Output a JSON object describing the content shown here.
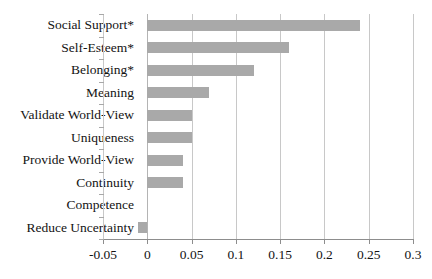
{
  "chart_data": {
    "type": "bar",
    "orientation": "horizontal",
    "title": "",
    "subtitle": "",
    "xlabel": "",
    "ylabel": "",
    "categories": [
      "Social Support*",
      "Self-Esteem*",
      "Belonging*",
      "Meaning",
      "Validate World-View",
      "Uniqueness",
      "Provide World-View",
      "Continuity",
      "Competence",
      "Reduce Uncertainty"
    ],
    "values": [
      0.24,
      0.16,
      0.12,
      0.07,
      0.05,
      0.05,
      0.04,
      0.04,
      0.0,
      -0.01
    ],
    "xlim": [
      -0.05,
      0.3
    ],
    "xticks": [
      -0.05,
      0,
      0.05,
      0.1,
      0.15,
      0.2,
      0.25,
      0.3
    ],
    "xtick_labels": [
      "-0.05",
      "0",
      "0.05",
      "0.1",
      "0.15",
      "0.2",
      "0.25",
      "0.3"
    ],
    "grid": true,
    "grid_axis": "x",
    "legend": false,
    "legend_position": "none",
    "bar_color": "#a9a9a9",
    "gridline_color": "#c8c8c8",
    "axis_color": "#8d8d8d",
    "background_color": "#ffffff",
    "annotations": [
      "* denotes statistical significance"
    ]
  }
}
